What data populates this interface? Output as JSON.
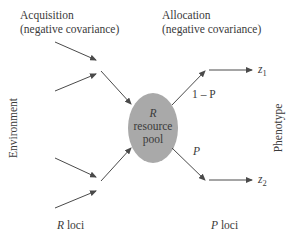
{
  "diagram": {
    "acquisition": {
      "title": "Acquisition",
      "subtitle": "(negative covariance)"
    },
    "allocation": {
      "title": "Allocation",
      "subtitle": "(negative covariance)"
    },
    "left_axis_label": "Environment",
    "right_axis_label": "Phenotype",
    "pool": {
      "symbol": "R",
      "line1": "resource",
      "line2": "pool",
      "fill": "#a9a9a9"
    },
    "branch_upper_label": "1 – P",
    "branch_lower_label": "P",
    "outputs": {
      "z1": "z",
      "z1_sub": "1",
      "z2": "z",
      "z2_sub": "2"
    },
    "bottom_left": {
      "symbol": "R",
      "text": " loci"
    },
    "bottom_right": {
      "symbol": "P",
      "text": " loci"
    },
    "arrow_color": "#4a4a4a"
  }
}
